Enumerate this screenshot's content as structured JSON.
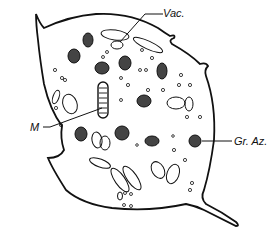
{
  "figure": {
    "labels": {
      "vac": "Vac.",
      "m": "M",
      "gr_az": "Gr. Az."
    },
    "colors": {
      "stroke": "#111111",
      "granule_fill": "#444444",
      "background": "#ffffff"
    }
  }
}
